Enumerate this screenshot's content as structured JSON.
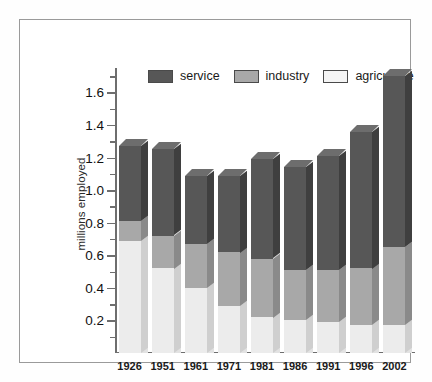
{
  "chart_data": {
    "type": "bar",
    "subtype": "stacked-bar-3d",
    "title": "",
    "xlabel": "",
    "ylabel": "millions employed",
    "ylim": [
      0,
      1.75
    ],
    "ytick_step": 0.2,
    "yminor_step": 0.1,
    "grid": false,
    "legend_position": "top-left-inside",
    "categories": [
      "1926",
      "1951",
      "1961",
      "1971",
      "1981",
      "1986",
      "1991",
      "1996",
      "2002"
    ],
    "ytick_labels": [
      "0.2",
      "0.4",
      "0.6",
      "0.8",
      "1.0",
      "1.2",
      "1.4",
      "1.6"
    ],
    "ytick_values": [
      0.2,
      0.4,
      0.6,
      0.8,
      1.0,
      1.2,
      1.4,
      1.6
    ],
    "series": [
      {
        "name": "agriculture",
        "color": "#ececec",
        "values": [
          0.69,
          0.52,
          0.4,
          0.29,
          0.22,
          0.2,
          0.19,
          0.17,
          0.17
        ]
      },
      {
        "name": "industry",
        "color": "#a8a8a8",
        "values": [
          0.12,
          0.2,
          0.27,
          0.33,
          0.36,
          0.31,
          0.32,
          0.35,
          0.48
        ]
      },
      {
        "name": "service",
        "color": "#575757",
        "values": [
          0.46,
          0.53,
          0.42,
          0.47,
          0.61,
          0.63,
          0.7,
          0.84,
          1.05
        ]
      }
    ],
    "cumulative_tops": {
      "agriculture": [
        0.69,
        0.52,
        0.4,
        0.29,
        0.22,
        0.2,
        0.19,
        0.17,
        0.17
      ],
      "industry": [
        0.81,
        0.72,
        0.67,
        0.62,
        0.58,
        0.51,
        0.51,
        0.52,
        0.65
      ],
      "service": [
        1.27,
        1.25,
        1.09,
        1.09,
        1.19,
        1.14,
        1.21,
        1.36,
        1.7
      ]
    },
    "totals": [
      1.27,
      1.25,
      1.09,
      1.09,
      1.19,
      1.14,
      1.21,
      1.36,
      1.7
    ]
  },
  "legend": {
    "items": [
      {
        "label": "service",
        "color": "#575757"
      },
      {
        "label": "industry",
        "color": "#a8a8a8"
      },
      {
        "label": "agriculture",
        "color": "#f4f4f4"
      }
    ]
  },
  "axis": {
    "y_title": "millions employed"
  }
}
